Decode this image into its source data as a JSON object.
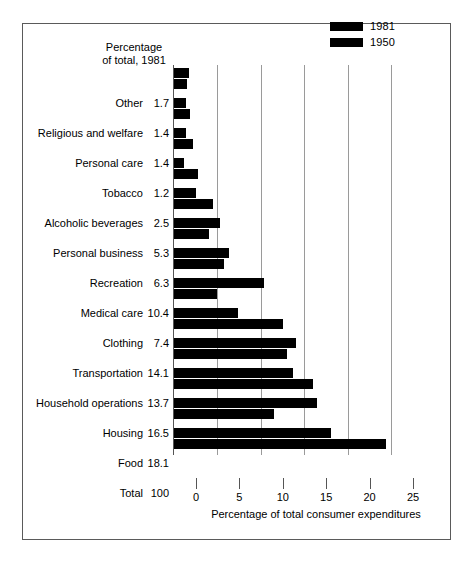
{
  "legend": {
    "entries": [
      {
        "label": "1981",
        "color": "#000000"
      },
      {
        "label": "1950",
        "color": "#000000"
      }
    ]
  },
  "column_heading": {
    "line1": "Percentage",
    "line2": "of total, 1981"
  },
  "total_row": {
    "label": "Total",
    "value": "100"
  },
  "chart_data": {
    "type": "bar",
    "orientation": "horizontal",
    "title": "",
    "subtitle": "",
    "xlabel": "Percentage of total consumer expenditures",
    "ylabel": "",
    "xlim": [
      0,
      25
    ],
    "xticks": [
      0,
      5,
      10,
      15,
      20,
      25
    ],
    "xtick_labels": [
      "0",
      "5",
      "10",
      "15",
      "20",
      "25"
    ],
    "grid": "vertical",
    "legend_position": "top-right",
    "value_column_header": "Percentage of total, 1981",
    "categories": [
      "Other",
      "Religious and welfare",
      "Personal care",
      "Tobacco",
      "Alcoholic beverages",
      "Personal business",
      "Recreation",
      "Medical care",
      "Clothing",
      "Transportation",
      "Household operations",
      "Housing",
      "Food"
    ],
    "labels_1981": [
      "1.7",
      "1.4",
      "1.4",
      "1.2",
      "2.5",
      "5.3",
      "6.3",
      "10.4",
      "7.4",
      "14.1",
      "13.7",
      "16.5",
      "18.1"
    ],
    "series": [
      {
        "name": "1981",
        "color": "#000000",
        "values": [
          1.7,
          1.4,
          1.4,
          1.2,
          2.5,
          5.3,
          6.3,
          10.4,
          7.4,
          14.1,
          13.7,
          16.5,
          18.1
        ]
      },
      {
        "name": "1950",
        "color": "#000000",
        "values": [
          1.5,
          1.9,
          2.2,
          2.8,
          4.5,
          4.0,
          5.8,
          5.0,
          12.5,
          13.0,
          16.0,
          11.5,
          24.4
        ]
      }
    ]
  }
}
